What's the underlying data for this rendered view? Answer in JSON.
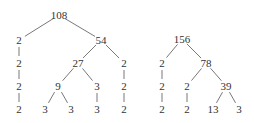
{
  "trees": [
    {
      "root": "108",
      "nodes": [
        {
          "id": "n108",
          "label": "108",
          "x": 59,
          "y": 15
        },
        {
          "id": "a2",
          "label": "2",
          "x": 19,
          "y": 40
        },
        {
          "id": "n54",
          "label": "54",
          "x": 101,
          "y": 40
        },
        {
          "id": "a2b",
          "label": "2",
          "x": 19,
          "y": 63
        },
        {
          "id": "n27",
          "label": "27",
          "x": 78,
          "y": 63
        },
        {
          "id": "b2",
          "label": "2",
          "x": 124,
          "y": 63
        },
        {
          "id": "a2c",
          "label": "2",
          "x": 19,
          "y": 86
        },
        {
          "id": "n9",
          "label": "9",
          "x": 58,
          "y": 86
        },
        {
          "id": "c3",
          "label": "3",
          "x": 97,
          "y": 86
        },
        {
          "id": "b2b",
          "label": "2",
          "x": 124,
          "y": 86
        },
        {
          "id": "a2d",
          "label": "2",
          "x": 19,
          "y": 109
        },
        {
          "id": "d3a",
          "label": "3",
          "x": 45,
          "y": 109
        },
        {
          "id": "d3b",
          "label": "3",
          "x": 71,
          "y": 109
        },
        {
          "id": "c3b",
          "label": "3",
          "x": 97,
          "y": 109
        },
        {
          "id": "b2c",
          "label": "2",
          "x": 124,
          "y": 109
        }
      ],
      "edges": [
        [
          "n108",
          "a2"
        ],
        [
          "n108",
          "n54"
        ],
        [
          "a2",
          "a2b"
        ],
        [
          "a2b",
          "a2c"
        ],
        [
          "a2c",
          "a2d"
        ],
        [
          "n54",
          "n27"
        ],
        [
          "n54",
          "b2"
        ],
        [
          "n27",
          "n9"
        ],
        [
          "n27",
          "c3"
        ],
        [
          "n9",
          "d3a"
        ],
        [
          "n9",
          "d3b"
        ],
        [
          "c3",
          "c3b"
        ],
        [
          "b2",
          "b2b"
        ],
        [
          "b2b",
          "b2c"
        ]
      ]
    },
    {
      "root": "156",
      "nodes": [
        {
          "id": "n156",
          "label": "156",
          "x": 182,
          "y": 39
        },
        {
          "id": "e2",
          "label": "2",
          "x": 162,
          "y": 63
        },
        {
          "id": "n78",
          "label": "78",
          "x": 206,
          "y": 63
        },
        {
          "id": "e2b",
          "label": "2",
          "x": 162,
          "y": 86
        },
        {
          "id": "f2",
          "label": "2",
          "x": 187,
          "y": 86
        },
        {
          "id": "n39",
          "label": "39",
          "x": 226,
          "y": 86
        },
        {
          "id": "e2c",
          "label": "2",
          "x": 162,
          "y": 109
        },
        {
          "id": "f2b",
          "label": "2",
          "x": 187,
          "y": 109
        },
        {
          "id": "n13",
          "label": "13",
          "x": 213,
          "y": 109
        },
        {
          "id": "g3",
          "label": "3",
          "x": 239,
          "y": 109
        }
      ],
      "edges": [
        [
          "n156",
          "e2"
        ],
        [
          "n156",
          "n78"
        ],
        [
          "e2",
          "e2b"
        ],
        [
          "e2b",
          "e2c"
        ],
        [
          "n78",
          "f2"
        ],
        [
          "n78",
          "n39"
        ],
        [
          "f2",
          "f2b"
        ],
        [
          "n39",
          "n13"
        ],
        [
          "n39",
          "g3"
        ]
      ]
    }
  ]
}
